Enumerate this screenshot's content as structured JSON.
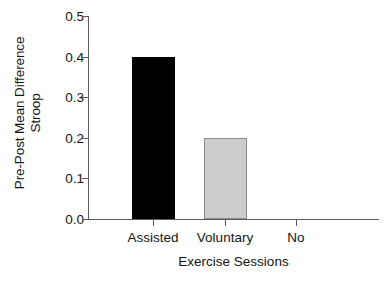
{
  "chart_data": {
    "type": "bar",
    "title": "",
    "subtitle": "",
    "categories": [
      "Assisted",
      "Voluntary",
      "No"
    ],
    "values": [
      0.4,
      0.2,
      0.0
    ],
    "xlabel": "Exercise Sessions",
    "ylabel_line1": "Pre-Post Mean Difference",
    "ylabel_line2": "Stroop",
    "ylim": [
      0.0,
      0.5
    ],
    "ytick_values": [
      0.5,
      0.4,
      0.3,
      0.2,
      0.1,
      0.0
    ],
    "ytick_labels": [
      "0.5",
      "0.4",
      "0.3",
      "0.2",
      "0.1",
      "0.0"
    ],
    "grid": false,
    "legend": false,
    "legend_position": "none",
    "bar_colors": [
      "#000000",
      "#cdcdcd",
      "#ffffff"
    ],
    "bar_border_colors": [
      "#000000",
      "#8c8c8c",
      "#ffffff"
    ],
    "axis_color": "#5d5d5d",
    "text_color": "#141414",
    "background": "#ffffff"
  }
}
